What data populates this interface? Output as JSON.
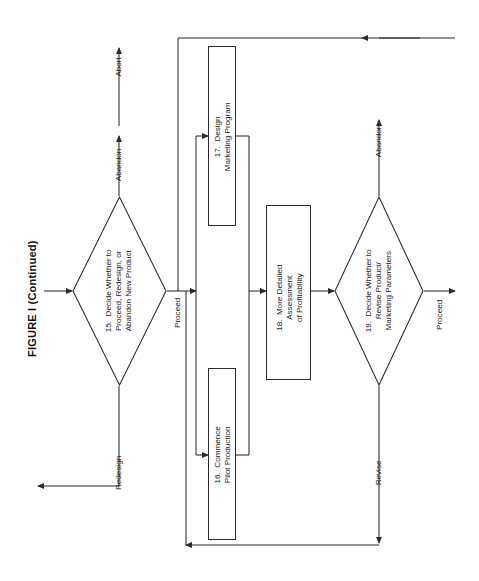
{
  "figure": {
    "title": "FIGURE I (Continued)",
    "orientation": "landscape-rotated-90-ccw"
  },
  "nodes": [
    {
      "id": "n15",
      "shape": "diamond",
      "number": "15.",
      "label": "15.  Decide Whether to\nProceed, Redesign, or\nAbandon New Product"
    },
    {
      "id": "n17",
      "shape": "process",
      "number": "17.",
      "label": "17.  Design\nMarketing Program"
    },
    {
      "id": "n16",
      "shape": "process",
      "number": "16.",
      "label": "16.  Commence\nPilot Production"
    },
    {
      "id": "n18",
      "shape": "process",
      "number": "18.",
      "label": "18.  More Detailed\nAssessment\nof Profitability"
    },
    {
      "id": "n19",
      "shape": "diamond",
      "number": "19.",
      "label": "19.  Decide Whether to\nRevise Product/\nMarketing Parameters"
    }
  ],
  "edge_labels": {
    "abandon_15": "Abandon",
    "abort": "Abort",
    "proceed_15": "Proceed",
    "redesign": "Redesign",
    "abandon_19": "Abandon",
    "revise": "Revise",
    "proceed_19": "Proceed"
  },
  "colors": {
    "stroke": "#2b2b2b",
    "text": "#1a1a1a",
    "background": "#ffffff"
  }
}
